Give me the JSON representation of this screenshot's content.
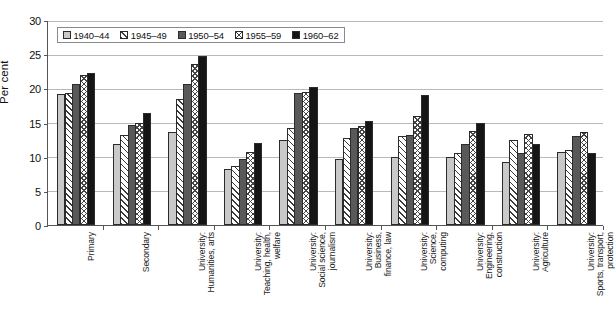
{
  "chart_data": {
    "type": "bar",
    "title": "",
    "xlabel": "",
    "ylabel": "Per cent",
    "ylim": [
      0,
      30
    ],
    "ytick_step": 5,
    "yticks": [
      "30",
      "25",
      "20",
      "15",
      "10",
      "5",
      "0"
    ],
    "grid": true,
    "legend_position": "top-left inside plot",
    "categories": [
      "Primary",
      "Secondary",
      "University:\nHumanities, arts",
      "University:\nTeaching, health,\nwelfare",
      "University:\nSocial science,\njournalism",
      "University:\nBusiness,\nfinance, law",
      "University:\nScience,\ncomputing",
      "University:\nEngineering,\nconstruction",
      "University:\nAgriculture",
      "University:\nSports, transport,\nprotection"
    ],
    "series": [
      {
        "name": "1940–44",
        "pattern": "solid-light-grey",
        "color": "#c9c9c9",
        "values": [
          19.1,
          11.8,
          13.6,
          8.2,
          12.5,
          9.7,
          10.0,
          10.0,
          9.2,
          10.7
        ]
      },
      {
        "name": "1945–49",
        "pattern": "diagonal-hatch",
        "color": "#ffffff",
        "values": [
          19.3,
          13.1,
          18.5,
          8.6,
          14.2,
          12.8,
          13.0,
          10.5,
          12.4,
          11.0
        ]
      },
      {
        "name": "1950–54",
        "pattern": "solid-dark-grey",
        "color": "#595959",
        "values": [
          20.7,
          14.6,
          20.6,
          9.6,
          19.3,
          14.2,
          13.1,
          11.9,
          10.6,
          13.0
        ]
      },
      {
        "name": "1955–59",
        "pattern": "cross-hatch",
        "color": "#ffffff",
        "values": [
          22.0,
          15.0,
          23.6,
          10.7,
          19.5,
          14.5,
          16.0,
          13.7,
          13.3,
          13.6
        ]
      },
      {
        "name": "1960–62",
        "pattern": "solid-black",
        "color": "#151515",
        "values": [
          22.3,
          16.4,
          24.7,
          12.0,
          20.2,
          15.2,
          19.0,
          14.9,
          11.9,
          10.6
        ]
      }
    ]
  }
}
